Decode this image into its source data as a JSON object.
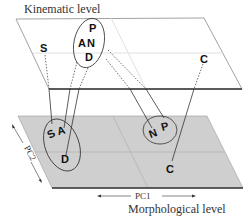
{
  "diagram": {
    "top_plane": {
      "title": "Kinematic level",
      "fill": "#ffffff",
      "points": [
        {
          "id": "S",
          "label": "S"
        },
        {
          "id": "P",
          "label": "P"
        },
        {
          "id": "A",
          "label": "A"
        },
        {
          "id": "N",
          "label": "N"
        },
        {
          "id": "D",
          "label": "D"
        },
        {
          "id": "C",
          "label": "C"
        }
      ],
      "clusters": [
        {
          "id": "PAND",
          "members": [
            "P",
            "A",
            "N",
            "D"
          ]
        }
      ]
    },
    "bottom_plane": {
      "title": "Morphological level",
      "fill": "#cfcfcf",
      "axis_x": "PC1",
      "axis_y": "PC2",
      "points": [
        {
          "id": "S",
          "label": "S"
        },
        {
          "id": "A",
          "label": "A"
        },
        {
          "id": "D",
          "label": "D"
        },
        {
          "id": "N",
          "label": "N"
        },
        {
          "id": "P",
          "label": "P"
        },
        {
          "id": "C",
          "label": "C"
        }
      ],
      "clusters": [
        {
          "id": "SAD",
          "members": [
            "S",
            "A",
            "D"
          ]
        },
        {
          "id": "NP",
          "members": [
            "N",
            "P"
          ]
        }
      ]
    },
    "connections": [
      {
        "from": "S",
        "to": "S"
      },
      {
        "from": "A",
        "to": "A"
      },
      {
        "from": "D",
        "to": "D"
      },
      {
        "from": "N",
        "to": "N"
      },
      {
        "from": "P",
        "to": "P"
      },
      {
        "from": "C",
        "to": "C"
      }
    ]
  }
}
